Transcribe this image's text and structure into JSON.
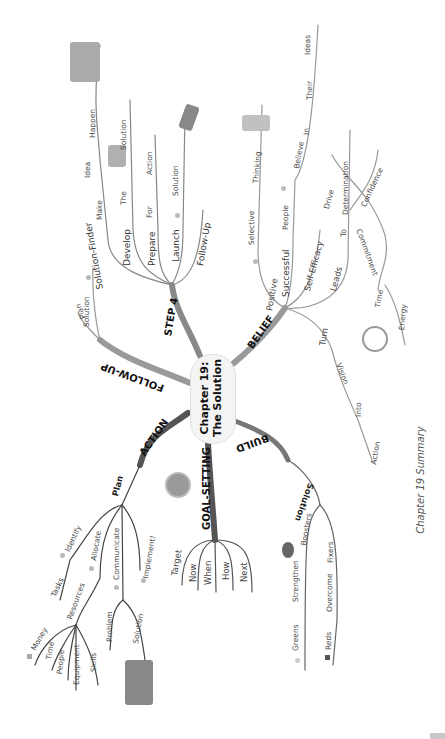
{
  "center": {
    "line1": "Chapter 19:",
    "line2": "The Solution"
  },
  "caption": "Chapter 19 Summary",
  "branches": {
    "step4": {
      "label": "STEP 4",
      "children": [
        {
          "label": "Solution-Finder",
          "tail": [
            "Make",
            "Idea",
            "Happen"
          ]
        },
        {
          "label": "Develop",
          "tail": [
            "The",
            "Solution"
          ]
        },
        {
          "label": "Prepare",
          "tail": [
            "For",
            "Action"
          ]
        },
        {
          "label": "Launch",
          "tail": [
            "Solution"
          ]
        },
        {
          "label": "Follow-Up",
          "tail": []
        }
      ]
    },
    "belief": {
      "label": "BELIEF",
      "children": [
        {
          "label": "Positive",
          "tail": [
            "Selective",
            "Thinking"
          ]
        },
        {
          "label": "Successful",
          "tail": [
            "People",
            "Believe",
            "In",
            "Their",
            "Ideas"
          ]
        },
        {
          "label": "Self-Efficacy",
          "tail": []
        },
        {
          "label": "Leads",
          "tail": [
            "To",
            "Drive",
            "Determination",
            "Confidence",
            "Commitment",
            "Time",
            "Energy"
          ]
        },
        {
          "label": "Turn",
          "tail": [
            "Vision",
            "Into",
            "Action"
          ]
        }
      ]
    },
    "follow_up": {
      "label": "FOLLOW-UP",
      "children": [
        {
          "label": "Plan"
        },
        {
          "label": "Solution"
        }
      ]
    },
    "action": {
      "label": "ACTION",
      "plan": "Plan",
      "children": [
        {
          "label": "Identify",
          "sub": [
            "Tasks"
          ]
        },
        {
          "label": "Allocate",
          "sub": [
            "Resources"
          ]
        },
        {
          "label": "Communicate",
          "sub": [
            "Problem",
            "Solution"
          ]
        },
        {
          "label": "Implement!",
          "sub": []
        }
      ],
      "resources": [
        "Money",
        "Time",
        "People",
        "Equipment",
        "Skills"
      ]
    },
    "goal_setting": {
      "label": "GOAL-SETTING",
      "children": [
        "Target",
        "Now",
        "When",
        "How",
        "Next"
      ]
    },
    "build": {
      "label": "BUILD",
      "solution": "Solution",
      "children": [
        {
          "label": "Boosters",
          "tail": [
            "Strengthen",
            "Greens"
          ]
        },
        {
          "label": "Fixers",
          "tail": [
            "Overcome",
            "Reds"
          ]
        }
      ]
    }
  }
}
